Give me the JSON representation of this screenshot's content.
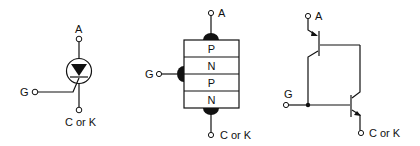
{
  "diagrams": {
    "symbol": {
      "title": "Thyristor schematic symbol",
      "anode_label": "A",
      "gate_label": "G",
      "cathode_label": "C or K"
    },
    "layers": {
      "title": "PNPN layer structure",
      "anode_label": "A",
      "gate_label": "G",
      "cathode_label": "C or K",
      "layers": [
        "P",
        "N",
        "P",
        "N"
      ]
    },
    "transistor_model": {
      "title": "Two-transistor equivalent",
      "anode_label": "A",
      "gate_label": "G",
      "cathode_label": "C or K"
    }
  },
  "colors": {
    "ink": "#111111",
    "background": "#ffffff"
  }
}
